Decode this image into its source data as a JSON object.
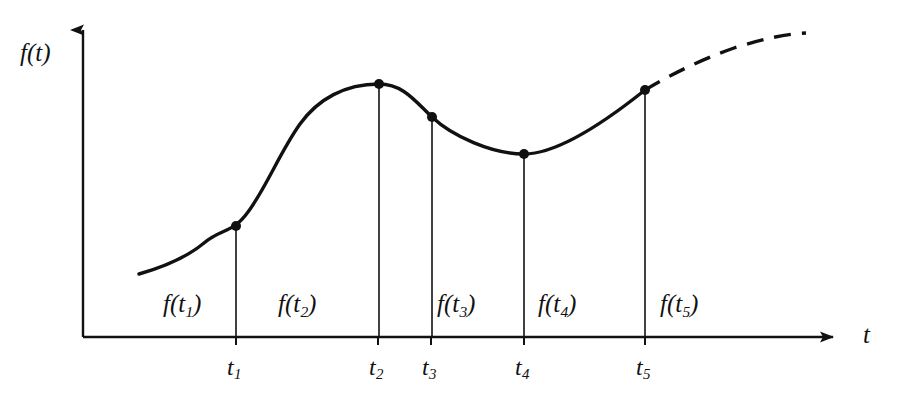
{
  "figure": {
    "caption_present": false,
    "background_color": "#ffffff",
    "ink_color": "#111111"
  },
  "axes": {
    "y_axis_label": "f(t)",
    "x_axis_label": "t",
    "origin": {
      "x": 83,
      "y": 337
    },
    "y_axis_top": {
      "x": 83,
      "y": 22
    },
    "x_axis_right": {
      "x": 845,
      "y": 337
    }
  },
  "tick_labels": [
    {
      "base": "t",
      "sub": "1",
      "x": 236
    },
    {
      "base": "t",
      "sub": "2",
      "x": 378
    },
    {
      "base": "t",
      "sub": "3",
      "x": 431
    },
    {
      "base": "t",
      "sub": "4",
      "x": 524
    },
    {
      "base": "t",
      "sub": "5",
      "x": 645
    }
  ],
  "segment_labels": [
    {
      "base": "f(t",
      "sub": "1",
      "close": ")"
    },
    {
      "base": "f(t",
      "sub": "2",
      "close": ")"
    },
    {
      "base": "f(t",
      "sub": "3",
      "close": ")"
    },
    {
      "base": "f(t",
      "sub": "4",
      "close": ")"
    },
    {
      "base": "f(t",
      "sub": "5",
      "close": ")"
    }
  ],
  "chart_data": {
    "type": "line",
    "title": "",
    "subtitle": "",
    "xlabel": "t",
    "ylabel": "f(t)",
    "grid": false,
    "legend": null,
    "axis_arrows": true,
    "xlim": [
      83,
      845
    ],
    "ylim": [
      337,
      22
    ],
    "note": "Pixel-space coordinates; y decreases upward. Smooth curve sampled at five instants t1..t5, each with a drop line to the t-axis; the curve continues past t5 as a dashed extrapolation.",
    "sample_points": [
      {
        "label": "t1",
        "x": 236,
        "y": 226,
        "segment_label": "f(t1)"
      },
      {
        "label": "t2",
        "x": 379,
        "y": 84,
        "segment_label": "f(t2)"
      },
      {
        "label": "t3",
        "x": 432,
        "y": 117,
        "segment_label": "f(t3)"
      },
      {
        "label": "t4",
        "x": 524,
        "y": 154,
        "segment_label": "f(t4)"
      },
      {
        "label": "t5",
        "x": 645,
        "y": 90,
        "segment_label": "f(t5)"
      }
    ],
    "curve_solid_path": [
      {
        "x": 139,
        "y": 274
      },
      {
        "x": 170,
        "y": 262
      },
      {
        "x": 200,
        "y": 246
      },
      {
        "x": 236,
        "y": 226
      },
      {
        "x": 268,
        "y": 198
      },
      {
        "x": 300,
        "y": 155
      },
      {
        "x": 330,
        "y": 115
      },
      {
        "x": 355,
        "y": 93
      },
      {
        "x": 379,
        "y": 84
      },
      {
        "x": 405,
        "y": 95
      },
      {
        "x": 432,
        "y": 117
      },
      {
        "x": 462,
        "y": 140
      },
      {
        "x": 492,
        "y": 152
      },
      {
        "x": 524,
        "y": 154
      },
      {
        "x": 560,
        "y": 145
      },
      {
        "x": 600,
        "y": 120
      },
      {
        "x": 645,
        "y": 90
      }
    ],
    "curve_dashed_path": [
      {
        "x": 645,
        "y": 90
      },
      {
        "x": 690,
        "y": 65
      },
      {
        "x": 730,
        "y": 49
      },
      {
        "x": 770,
        "y": 39
      },
      {
        "x": 806,
        "y": 34
      }
    ],
    "drop_lines": [
      {
        "label": "t1",
        "x": 236,
        "y_top": 226,
        "y_bottom": 337
      },
      {
        "label": "t2",
        "x": 379,
        "y_top": 84,
        "y_bottom": 337
      },
      {
        "label": "t3",
        "x": 432,
        "y_top": 117,
        "y_bottom": 337
      },
      {
        "label": "t4",
        "x": 524,
        "y_top": 154,
        "y_bottom": 337
      },
      {
        "label": "t5",
        "x": 645,
        "y_top": 90,
        "y_bottom": 337
      }
    ],
    "tick_marks_x": [
      236,
      378,
      431,
      524,
      645
    ]
  }
}
